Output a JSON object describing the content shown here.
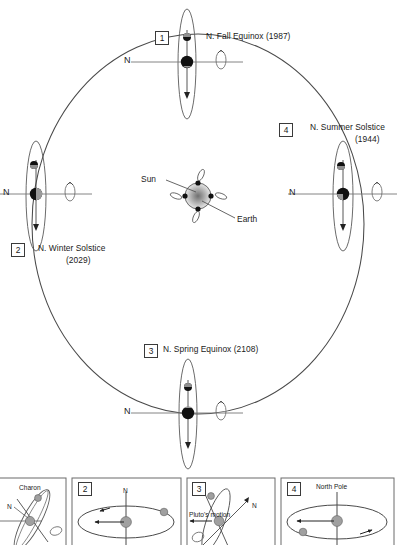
{
  "figure": {
    "orbit": {
      "center_label_sun": "Sun",
      "center_label_earth": "Earth",
      "n_marker": "N"
    },
    "positions": [
      {
        "number": "1",
        "label": "N. Fall Equinox (1987)",
        "event": "N. Fall Equinox",
        "year": "1987",
        "orbit_angle_deg": 90,
        "n_marker": "N"
      },
      {
        "number": "4",
        "label_line1": "N. Summer Solstice",
        "label_line2": "(1944)",
        "event": "N. Summer Solstice",
        "year": "1944",
        "orbit_angle_deg": 0,
        "n_marker": "N"
      },
      {
        "number": "2",
        "label_line1": "N. Winter Solstice",
        "label_line2": "(2029)",
        "event": "N. Winter Solstice",
        "year": "2029",
        "orbit_angle_deg": 180,
        "n_marker": "N"
      },
      {
        "number": "3",
        "label": "N. Spring Equinox (2108)",
        "event": "N. Spring Equinox",
        "year": "2108",
        "orbit_angle_deg": 270,
        "n_marker": "N"
      }
    ],
    "panels": [
      {
        "number": "1",
        "labels": [
          "Charon",
          "N"
        ]
      },
      {
        "number": "2",
        "labels": [
          "N"
        ]
      },
      {
        "number": "3",
        "labels": [
          "Pluto's motion",
          "N"
        ]
      },
      {
        "number": "4",
        "labels": [
          "North Pole"
        ]
      }
    ],
    "colors": {
      "stroke": "#4a4a4a",
      "body_dark": "#111111",
      "body_gray": "#9a9a9a",
      "sun_glow": "#8a8a8a",
      "panel_border": "#6a6a6a"
    }
  }
}
